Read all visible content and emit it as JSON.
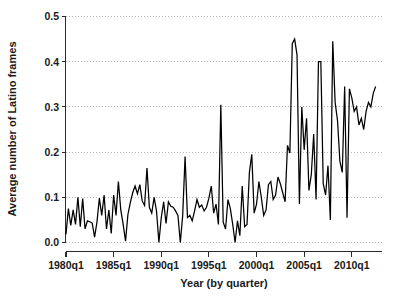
{
  "chart_data": {
    "type": "line",
    "title": "",
    "xlabel": "Year (by quarter)",
    "ylabel": "Average number of Latino frames",
    "xlim": [
      1980.0,
      2012.75
    ],
    "ylim": [
      0.0,
      0.5
    ],
    "grid": true,
    "legend": null,
    "y_ticks": [
      "0.0",
      "0.1",
      "0.2",
      "0.3",
      "0.4",
      "0.5"
    ],
    "y_tick_values": [
      0.0,
      0.1,
      0.2,
      0.3,
      0.4,
      0.5
    ],
    "x_ticks": [
      "1980q1",
      "1985q1",
      "1990q1",
      "1995q1",
      "2000q1",
      "2005q1",
      "2010q1"
    ],
    "x_tick_values": [
      1980.0,
      1985.0,
      1990.0,
      1995.0,
      2000.0,
      2005.0,
      2010.0
    ],
    "series": [
      {
        "name": "Average number of Latino frames",
        "x": [
          1980.0,
          1980.25,
          1980.5,
          1980.75,
          1981.0,
          1981.25,
          1981.5,
          1981.75,
          1982.0,
          1982.25,
          1982.5,
          1982.75,
          1983.0,
          1983.25,
          1983.5,
          1983.75,
          1984.0,
          1984.25,
          1984.5,
          1984.75,
          1985.0,
          1985.25,
          1985.5,
          1985.75,
          1986.0,
          1986.25,
          1986.5,
          1986.75,
          1987.0,
          1987.25,
          1987.5,
          1987.75,
          1988.0,
          1988.25,
          1988.5,
          1988.75,
          1989.0,
          1989.25,
          1989.5,
          1989.75,
          1990.0,
          1990.25,
          1990.5,
          1990.75,
          1991.0,
          1991.25,
          1991.5,
          1991.75,
          1992.0,
          1992.25,
          1992.5,
          1992.75,
          1993.0,
          1993.25,
          1993.5,
          1993.75,
          1994.0,
          1994.25,
          1994.5,
          1994.75,
          1995.0,
          1995.25,
          1995.5,
          1995.75,
          1996.0,
          1996.25,
          1996.5,
          1996.75,
          1997.0,
          1997.25,
          1997.5,
          1997.75,
          1998.0,
          1998.25,
          1998.5,
          1998.75,
          1999.0,
          1999.25,
          1999.5,
          1999.75,
          2000.0,
          2000.25,
          2000.5,
          2000.75,
          2001.0,
          2001.25,
          2001.5,
          2001.75,
          2002.0,
          2002.25,
          2002.5,
          2002.75,
          2003.0,
          2003.25,
          2003.5,
          2003.75,
          2004.0,
          2004.25,
          2004.5,
          2004.75,
          2005.0,
          2005.25,
          2005.5,
          2005.75,
          2006.0,
          2006.25,
          2006.5,
          2006.75,
          2007.0,
          2007.25,
          2007.5,
          2007.75,
          2008.0,
          2008.25,
          2008.5,
          2008.75,
          2009.0,
          2009.25,
          2009.5,
          2009.75,
          2010.0,
          2010.25,
          2010.5,
          2010.75,
          2011.0,
          2011.25,
          2011.5,
          2011.75,
          2012.0,
          2012.25,
          2012.5
        ],
        "values": [
          0.018,
          0.075,
          0.038,
          0.072,
          0.04,
          0.1,
          0.035,
          0.097,
          0.03,
          0.048,
          0.046,
          0.043,
          0.012,
          0.045,
          0.098,
          0.06,
          0.105,
          0.03,
          0.072,
          0.02,
          0.105,
          0.06,
          0.135,
          0.072,
          0.04,
          0.003,
          0.062,
          0.088,
          0.11,
          0.125,
          0.108,
          0.128,
          0.092,
          0.082,
          0.165,
          0.078,
          0.065,
          0.1,
          0.07,
          0.0,
          0.055,
          0.09,
          0.042,
          0.09,
          0.08,
          0.078,
          0.07,
          0.06,
          0.0,
          0.06,
          0.19,
          0.055,
          0.06,
          0.048,
          0.07,
          0.095,
          0.078,
          0.083,
          0.07,
          0.078,
          0.098,
          0.125,
          0.065,
          0.085,
          0.04,
          0.305,
          0.045,
          0.03,
          0.095,
          0.075,
          0.04,
          0.0,
          0.048,
          0.015,
          0.125,
          0.035,
          0.04,
          0.155,
          0.195,
          0.065,
          0.085,
          0.135,
          0.1,
          0.06,
          0.072,
          0.128,
          0.135,
          0.095,
          0.105,
          0.145,
          0.13,
          0.11,
          0.09,
          0.215,
          0.198,
          0.44,
          0.45,
          0.415,
          0.085,
          0.3,
          0.205,
          0.275,
          0.115,
          0.15,
          0.24,
          0.095,
          0.4,
          0.4,
          0.13,
          0.105,
          0.17,
          0.05,
          0.445,
          0.31,
          0.27,
          0.18,
          0.155,
          0.345,
          0.055,
          0.34,
          0.32,
          0.29,
          0.3,
          0.26,
          0.275,
          0.25,
          0.29,
          0.31,
          0.3,
          0.33,
          0.345
        ]
      }
    ]
  }
}
